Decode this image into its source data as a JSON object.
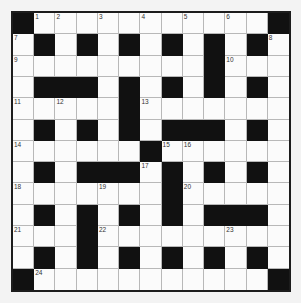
{
  "puzzle": {
    "rows": 13,
    "cols": 13,
    "grid": [
      "#...........#",
      ".#.#.#.#.#.#.",
      ".........#...",
      ".###.#.#.#.#.",
      ".....#.......",
      ".#.#.#.###.#.",
      "......#......",
      ".#.###.#.#.#.",
      ".......#.....",
      ".#.#.#.#.###.",
      "...#.........",
      ".#.#.#.#.#.#.",
      "#...........#"
    ],
    "numbers": [
      {
        "r": 0,
        "c": 1,
        "n": "1"
      },
      {
        "r": 0,
        "c": 2,
        "n": "2"
      },
      {
        "r": 0,
        "c": 4,
        "n": "3"
      },
      {
        "r": 0,
        "c": 6,
        "n": "4"
      },
      {
        "r": 0,
        "c": 8,
        "n": "5"
      },
      {
        "r": 0,
        "c": 10,
        "n": "6"
      },
      {
        "r": 1,
        "c": 0,
        "n": "7"
      },
      {
        "r": 1,
        "c": 12,
        "n": "8"
      },
      {
        "r": 2,
        "c": 0,
        "n": "9"
      },
      {
        "r": 2,
        "c": 10,
        "n": "10"
      },
      {
        "r": 4,
        "c": 0,
        "n": "11"
      },
      {
        "r": 4,
        "c": 2,
        "n": "12"
      },
      {
        "r": 4,
        "c": 6,
        "n": "13"
      },
      {
        "r": 6,
        "c": 0,
        "n": "14"
      },
      {
        "r": 6,
        "c": 7,
        "n": "15"
      },
      {
        "r": 6,
        "c": 8,
        "n": "16"
      },
      {
        "r": 7,
        "c": 6,
        "n": "17"
      },
      {
        "r": 8,
        "c": 0,
        "n": "18"
      },
      {
        "r": 8,
        "c": 4,
        "n": "19"
      },
      {
        "r": 8,
        "c": 8,
        "n": "20"
      },
      {
        "r": 10,
        "c": 0,
        "n": "21"
      },
      {
        "r": 10,
        "c": 4,
        "n": "22"
      },
      {
        "r": 10,
        "c": 10,
        "n": "23"
      },
      {
        "r": 12,
        "c": 1,
        "n": "24"
      }
    ]
  },
  "colors": {
    "black_cell": "#111111",
    "white_cell": "#fbfbfb",
    "border": "#1c1c1c"
  }
}
